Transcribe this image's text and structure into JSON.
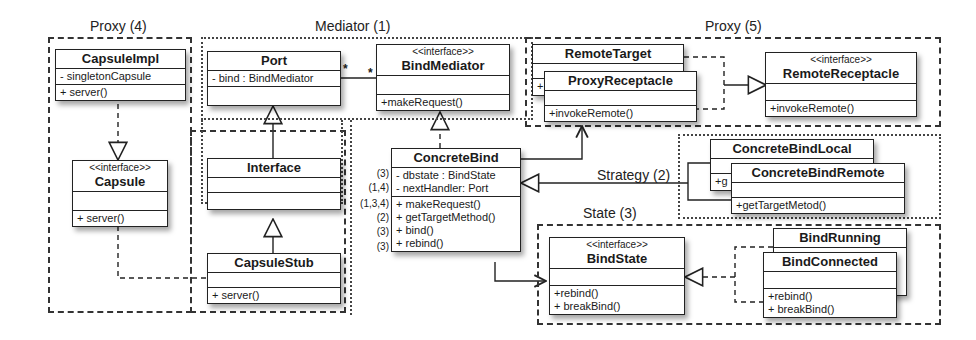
{
  "frames": {
    "proxy4": "Proxy (4)",
    "mediator1": "Mediator (1)",
    "proxy5": "Proxy (5)",
    "strategy2": "Strategy (2)",
    "state3": "State (3)"
  },
  "classes": {
    "capsuleImpl": {
      "name": "CapsuleImpl",
      "attributes": [
        "- singletonCapsule"
      ],
      "methods": [
        "+ server()"
      ]
    },
    "capsule": {
      "stereotype": "<<interface>>",
      "name": "Capsule",
      "methods": [
        "+ server()"
      ]
    },
    "port": {
      "name": "Port",
      "attributes": [
        "- bind : BindMediator"
      ]
    },
    "bindMediator": {
      "stereotype": "<<interface>>",
      "name": "BindMediator",
      "methods": [
        "+makeRequest()"
      ]
    },
    "interface": {
      "name": "Interface"
    },
    "capsuleStub": {
      "name": "CapsuleStub",
      "methods": [
        "+ server()"
      ]
    },
    "concreteBind": {
      "name": "ConcreteBind",
      "attributes": [
        "- dbstate : BindState",
        "- nextHandler: Port"
      ],
      "attribute_tags": [
        "(3)",
        "(1,4)"
      ],
      "methods": [
        "+ makeRequest()",
        "+ getTargetMethod()",
        "+ bind()",
        "+ rebind()"
      ],
      "method_tags": [
        "(1,3,4)",
        "(2)",
        "(3)",
        "(3)"
      ]
    },
    "remoteTarget": {
      "name": "RemoteTarget",
      "methods_partial": "+"
    },
    "proxyReceptacle": {
      "name": "ProxyReceptacle",
      "methods": [
        "+invokeRemote()"
      ]
    },
    "remoteReceptacle": {
      "stereotype": "<<interface>>",
      "name": "RemoteReceptacle",
      "methods": [
        "+invokeRemote()"
      ]
    },
    "concreteBindLocal": {
      "name": "ConcreteBindLocal",
      "methods_partial": "+g"
    },
    "concreteBindRemote": {
      "name": "ConcreteBindRemote",
      "methods": [
        "+getTargetMetod()"
      ]
    },
    "bindState": {
      "stereotype": "<<interface>>",
      "name": "BindState",
      "methods": [
        "+rebind()",
        "+ breakBind()"
      ]
    },
    "bindRunning": {
      "name": "BindRunning"
    },
    "bindConnected": {
      "name": "BindConnected",
      "methods": [
        "+rebind()",
        "+ breakBind()"
      ]
    }
  },
  "multiplicity": {
    "port_end": "*",
    "mediator_end": "*"
  }
}
